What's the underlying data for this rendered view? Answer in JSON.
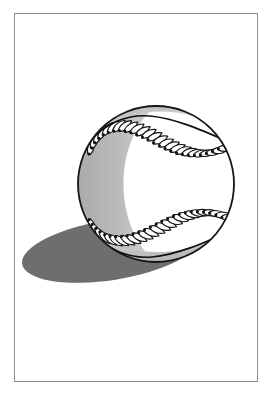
{
  "artwork": {
    "title": "Baseball illustration",
    "subject": "baseball",
    "style": "black-and-white line drawing with gray shading and cast shadow",
    "canvas": {
      "width": 271,
      "height": 399,
      "background": "#ffffff"
    },
    "frame": {
      "name": "picture-frame-border",
      "x": 14,
      "y": 13,
      "width": 243,
      "height": 368,
      "stroke": "#8c8c8c",
      "stroke_width": 1,
      "fill": "#ffffff"
    },
    "ball": {
      "name": "baseball",
      "center_x": 156,
      "center_y": 184,
      "radius": 78,
      "fill": "#ffffff",
      "outline": "#151515",
      "outline_width": 1.8
    },
    "shading": {
      "left_crescent_color": "#b8b8b8",
      "bottom_crescent_color": "#c9c9c9",
      "top_arc_color": "#bdbdbd",
      "inner_highlight_color": "#ffffff"
    },
    "shadow": {
      "name": "cast-shadow",
      "color": "#6e6e6e",
      "center_x": 111,
      "center_y": 250,
      "radius_x": 90,
      "radius_y": 30,
      "rotation_deg": -9
    },
    "seams": {
      "count": 2,
      "stitch_color": "#111111",
      "seam_color": "#111111",
      "top_seam": {
        "name": "top-seam",
        "stitch_count": 24
      },
      "bottom_seam": {
        "name": "bottom-seam",
        "stitch_count": 24
      }
    }
  }
}
